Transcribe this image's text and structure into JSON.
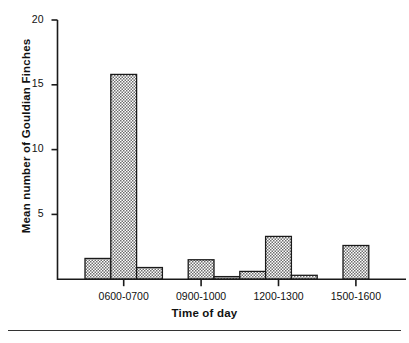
{
  "chart_data": {
    "type": "bar",
    "title": "",
    "xlabel": "Time of day",
    "ylabel": "Mean number of Gouldian Finches",
    "ylim": [
      0,
      20
    ],
    "yticks": [
      5,
      10,
      15,
      20
    ],
    "ytick_labels": [
      "5",
      "10",
      "15",
      "20"
    ],
    "grid": false,
    "legend": null,
    "xtick_labels": [
      "0600-0700",
      "0900-1000",
      "1200-1300",
      "1500-1600"
    ],
    "xtick_positions": [
      1.5,
      4.5,
      7.5,
      10.5
    ],
    "categories": [
      "0500-0600",
      "0600-0700",
      "0700-0800",
      "0800-0900",
      "0900-1000",
      "1000-1100",
      "1100-1200",
      "1200-1300",
      "1300-1400",
      "1400-1500",
      "1500-1600",
      "1600-1700"
    ],
    "values": [
      1.6,
      15.8,
      0.9,
      0.0,
      1.5,
      0.2,
      0.6,
      3.3,
      0.3,
      0.0,
      2.6,
      0.0
    ],
    "bar_fill_pattern": "checkerboard-stipple",
    "bar_fill_color": "#b5b5b5",
    "bar_edge_color": "#1a1a1a",
    "axis_color": "#1a1a1a"
  },
  "axes": {
    "y_ticks": [
      {
        "label": "20",
        "value": 20
      },
      {
        "label": "15",
        "value": 15
      },
      {
        "label": "10",
        "value": 10
      },
      {
        "label": "5",
        "value": 5
      }
    ],
    "x_ticks": [
      {
        "label": "0600-0700"
      },
      {
        "label": "0900-1000"
      },
      {
        "label": "1200-1300"
      },
      {
        "label": "1500-1600"
      }
    ]
  },
  "labels": {
    "y_axis_title": "Mean number of Gouldian Finches",
    "x_axis_title": "Time of day"
  }
}
